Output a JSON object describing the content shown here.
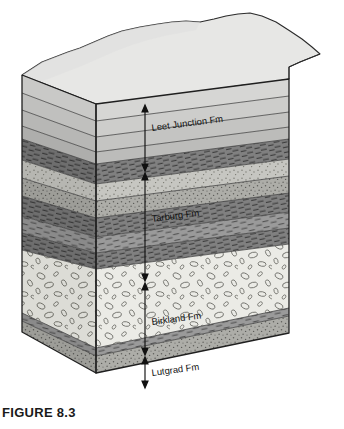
{
  "figure": {
    "caption": "FIGURE 8.3",
    "type": "geologic-block-diagram"
  },
  "formations": [
    {
      "id": "leet-junction",
      "label": "Leet Junction Fm",
      "rock_type": "shale-siltstone",
      "order": 1,
      "top_depth_pct": 0,
      "bottom_depth_pct": 24,
      "color": "#d3d3d3"
    },
    {
      "id": "tarburg",
      "label": "Tarburg Fm",
      "rock_type": "interbedded shale and sandstone",
      "order": 2,
      "top_depth_pct": 24,
      "bottom_depth_pct": 58,
      "color": "#a8a8a8"
    },
    {
      "id": "birkland",
      "label": "Birkland Fm",
      "rock_type": "conglomerate",
      "order": 3,
      "top_depth_pct": 58,
      "bottom_depth_pct": 84,
      "color": "#e6e6e2"
    },
    {
      "id": "lutgrad",
      "label": "Lutgrad Fm",
      "rock_type": "sandstone",
      "order": 4,
      "top_depth_pct": 84,
      "bottom_depth_pct": 100,
      "color": "#b5b5b0"
    }
  ],
  "colors": {
    "top_surface": "#e7e7e5",
    "top_surface_shadow": "#d9d9d7",
    "outline": "#1f1f1f",
    "measure_line": "#111111",
    "shale_dark": "#6f6f6f",
    "shale_mid": "#8c8c8c",
    "sandstone_light": "#c9c9c4",
    "sandstone_mid": "#b0b0ab",
    "conglomerate": "#e9e9e4",
    "conglomerate_side": "#d8d8d2",
    "background": "#ffffff"
  },
  "icons": {
    "arrow_up": "arrow-up-icon",
    "arrow_down": "arrow-down-icon",
    "measure_bar": "measure-bar-icon"
  }
}
